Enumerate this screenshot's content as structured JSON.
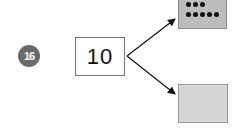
{
  "problem": {
    "number": "16",
    "total": "10",
    "parts": [
      {
        "label": "top-part",
        "dots": 8,
        "dot_rows": [
          3,
          5
        ],
        "fill": "#bdbdbd"
      },
      {
        "label": "bottom-part",
        "value": "",
        "fill": "#d6d6d6"
      }
    ]
  },
  "colors": {
    "badge": "#6a6a6a",
    "arrow": "#111111"
  }
}
